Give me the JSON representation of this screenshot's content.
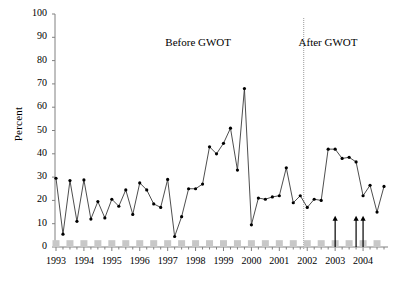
{
  "chart_data": {
    "type": "line",
    "title": "",
    "xlabel": "",
    "ylabel": "Percent",
    "ylim": [
      0,
      100
    ],
    "yticks": [
      0,
      10,
      20,
      30,
      40,
      50,
      60,
      70,
      80,
      90,
      100
    ],
    "xticks": [
      "1993",
      "1994",
      "1995",
      "1996",
      "1997",
      "1998",
      "1999",
      "2000",
      "2001",
      "2002",
      "2003",
      "2004"
    ],
    "grid": false,
    "legend": null,
    "x": [
      "1993 Q1",
      "1993 Q2",
      "1993 Q3",
      "1993 Q4",
      "1994 Q1",
      "1994 Q2",
      "1994 Q3",
      "1994 Q4",
      "1995 Q1",
      "1995 Q2",
      "1995 Q3",
      "1995 Q4",
      "1996 Q1",
      "1996 Q2",
      "1996 Q3",
      "1996 Q4",
      "1997 Q1",
      "1997 Q2",
      "1997 Q3",
      "1997 Q4",
      "1998 Q1",
      "1998 Q2",
      "1998 Q3",
      "1998 Q4",
      "1999 Q1",
      "1999 Q2",
      "1999 Q3",
      "1999 Q4",
      "2000 Q1",
      "2000 Q2",
      "2000 Q3",
      "2000 Q4",
      "2001 Q1",
      "2001 Q2",
      "2001 Q3",
      "2001 Q4",
      "2002 Q1",
      "2002 Q2",
      "2002 Q3",
      "2002 Q4",
      "2003 Q1",
      "2003 Q2",
      "2003 Q3",
      "2003 Q4",
      "2004 Q1",
      "2004 Q2",
      "2004 Q3",
      "2004 Q4"
    ],
    "series": [
      {
        "name": "Percent",
        "values": [
          29.5,
          5.5,
          28.5,
          11.0,
          28.8,
          12.0,
          19.5,
          12.5,
          20.5,
          17.5,
          24.5,
          14.0,
          27.5,
          24.5,
          18.5,
          17.0,
          29.0,
          4.5,
          13.0,
          25.0,
          25.0,
          27.0,
          43.0,
          40.0,
          44.5,
          51.0,
          33.0,
          68.0,
          9.5,
          21.0,
          20.5,
          21.5,
          22.0,
          34.0,
          19.0,
          22.0,
          17.0,
          20.5,
          20.0,
          42.0,
          42.0,
          38.0,
          38.5,
          36.5,
          22.0,
          26.5,
          15.0,
          26.0
        ]
      }
    ],
    "annotations": [
      {
        "name": "before-gwot-label",
        "text": "Before  GWOT",
        "x_pct": 43.0,
        "y_pct": 88.0
      },
      {
        "name": "after-gwot-label",
        "text": "After  GWOT",
        "x_pct": 82.0,
        "y_pct": 88.0
      }
    ],
    "divider": {
      "name": "gwot-divider-line",
      "label": "GWOT start",
      "x_value": "2001 Q4"
    },
    "arrows": [
      {
        "name": "event-arrow-1",
        "x_value": "2003 Q1",
        "height": 8
      },
      {
        "name": "event-arrow-2",
        "x_value": "2003 Q4",
        "height": 8
      },
      {
        "name": "event-arrow-3",
        "x_value": "2004 Q1",
        "height": 8
      }
    ],
    "baseline_markers": {
      "name": "baseline-square-markers",
      "color": "#c8c8c8",
      "shape": "square",
      "at_x": [
        "1993 Q1",
        "1993 Q3",
        "1994 Q1",
        "1994 Q3",
        "1995 Q1",
        "1995 Q3",
        "1996 Q1",
        "1996 Q3",
        "1997 Q1",
        "1997 Q3",
        "1998 Q1",
        "1998 Q3",
        "1999 Q1",
        "1999 Q3",
        "2000 Q1",
        "2000 Q3",
        "2001 Q1",
        "2001 Q3",
        "2002 Q1",
        "2002 Q3",
        "2003 Q1",
        "2003 Q3",
        "2004 Q1",
        "2004 Q3"
      ],
      "value": 1
    },
    "colors": {
      "line": "#3a3a3a",
      "marker": "#000000",
      "axis": "#808080",
      "divider": "#9a9a9a",
      "baseline_marker": "#c8c8c8",
      "arrow": "#000000",
      "background": "#ffffff"
    }
  }
}
